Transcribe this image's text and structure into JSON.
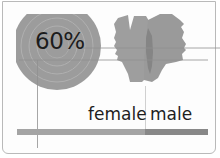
{
  "infographic": {
    "headline_value": "60%",
    "labels": {
      "female": "female",
      "male": "male"
    },
    "split_bar": {
      "female_share": 0.67,
      "male_share": 0.33
    },
    "colors": {
      "circle": "#9c9c9c",
      "circle_ring": "#b2b2b2",
      "silhouette": "#9e9e9e",
      "silhouette_shadow": "#7c7c7c",
      "bar_female": "#a4a4a4",
      "bar_male": "#888888",
      "line": "#8f8f8f",
      "text": "#1e1e1e"
    },
    "icons": [
      "concentric-circle-icon",
      "female-head-silhouette-icon",
      "male-head-silhouette-icon"
    ]
  }
}
